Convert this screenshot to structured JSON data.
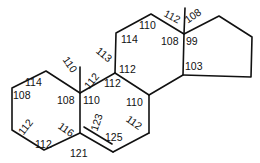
{
  "diagram": {
    "type": "steroid skeleton with bond angles (degrees)",
    "rings": [
      "A",
      "B",
      "C",
      "D"
    ],
    "angle_labels": [
      {
        "id": "a1",
        "text": "114",
        "x": 25,
        "y": 86,
        "rot": 0
      },
      {
        "id": "a2",
        "text": "108",
        "x": 13,
        "y": 99,
        "rot": 0
      },
      {
        "id": "a3",
        "text": "112",
        "x": 17,
        "y": 131,
        "rot": -52
      },
      {
        "id": "a4",
        "text": "112",
        "x": 35,
        "y": 148,
        "rot": 0
      },
      {
        "id": "a5",
        "text": "116",
        "x": 58,
        "y": 133,
        "rot": 35
      },
      {
        "id": "a6",
        "text": "108",
        "x": 57,
        "y": 104,
        "rot": 0
      },
      {
        "id": "a7",
        "text": "110",
        "x": 62,
        "y": 68,
        "rot": 55
      },
      {
        "id": "a8",
        "text": "112",
        "x": 83,
        "y": 85,
        "rot": -50
      },
      {
        "id": "a9",
        "text": "110",
        "x": 83,
        "y": 104,
        "rot": 0
      },
      {
        "id": "a10",
        "text": "113",
        "x": 96,
        "y": 58,
        "rot": 40
      },
      {
        "id": "a11",
        "text": "112",
        "x": 119,
        "y": 73,
        "rot": 0
      },
      {
        "id": "a12",
        "text": "112",
        "x": 104,
        "y": 87,
        "rot": 0
      },
      {
        "id": "a13",
        "text": "114",
        "x": 121,
        "y": 43,
        "rot": 0
      },
      {
        "id": "a14",
        "text": "110",
        "x": 139,
        "y": 29,
        "rot": 0
      },
      {
        "id": "a15",
        "text": "112",
        "x": 164,
        "y": 20,
        "rot": 28
      },
      {
        "id": "a16",
        "text": "108",
        "x": 184,
        "y": 20,
        "rot": -35
      },
      {
        "id": "a17",
        "text": "108",
        "x": 161,
        "y": 45,
        "rot": 0
      },
      {
        "id": "a18",
        "text": "99",
        "x": 186,
        "y": 45,
        "rot": 0
      },
      {
        "id": "a19",
        "text": "103",
        "x": 185,
        "y": 70,
        "rot": 0
      },
      {
        "id": "a20",
        "text": "110",
        "x": 126,
        "y": 106,
        "rot": 0
      },
      {
        "id": "a21",
        "text": "112",
        "x": 126,
        "y": 126,
        "rot": 35
      },
      {
        "id": "a22",
        "text": "123",
        "x": 88,
        "y": 127,
        "rot": -72
      },
      {
        "id": "a23",
        "text": "125",
        "x": 105,
        "y": 141,
        "rot": 0
      },
      {
        "id": "a24",
        "text": "121",
        "x": 70,
        "y": 157,
        "rot": 0
      }
    ]
  }
}
